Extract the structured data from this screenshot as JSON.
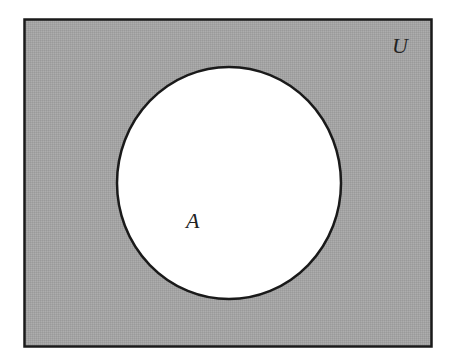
{
  "diagram": {
    "type": "venn",
    "universe": {
      "label": "U",
      "fill": "#a3a3a3",
      "stroke": "#1a1a1a",
      "x": 24,
      "y": 19,
      "width": 408,
      "height": 328
    },
    "sets": [
      {
        "label": "A",
        "fill": "#ffffff",
        "stroke": "#1a1a1a",
        "cx": 229,
        "cy": 183,
        "rx": 112,
        "ry": 116
      }
    ],
    "shaded_region": "complement of A (A')"
  }
}
